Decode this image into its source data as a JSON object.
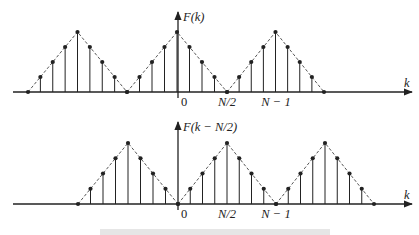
{
  "figure": {
    "colors": {
      "ink": "#222222",
      "dash": "#444444",
      "caption": "#e6e6e6"
    },
    "top_plot": {
      "name": "original-spectrum",
      "y_label": "F(k)",
      "x_label": "k",
      "baseline_y": 92,
      "axis_x": 178,
      "axis_top": 12,
      "x_start": 13,
      "x_end": 412,
      "peak_height": 60,
      "triangles": [
        {
          "start": 28,
          "end": 127
        },
        {
          "start": 127,
          "end": 227
        },
        {
          "start": 227,
          "end": 324
        }
      ],
      "ticks": [
        {
          "label": "0",
          "x": 181,
          "italic": false
        },
        {
          "label": "N/2",
          "x": 227,
          "italic": true
        },
        {
          "label": "N − 1",
          "x": 276,
          "italic": true
        }
      ]
    },
    "bottom_plot": {
      "name": "shifted-spectrum",
      "y_label": "F(k − N/2)",
      "x_label": "k",
      "baseline_y": 204,
      "axis_x": 178,
      "axis_top": 122,
      "x_start": 13,
      "x_end": 412,
      "peak_height": 61,
      "triangles": [
        {
          "start": 78,
          "end": 178
        },
        {
          "start": 178,
          "end": 276
        },
        {
          "start": 276,
          "end": 374
        }
      ],
      "ticks": [
        {
          "label": "0",
          "x": 181,
          "italic": false
        },
        {
          "label": "N/2",
          "x": 227,
          "italic": true
        },
        {
          "label": "N − 1",
          "x": 276,
          "italic": true
        }
      ]
    },
    "samples_per_half_period": 4
  }
}
